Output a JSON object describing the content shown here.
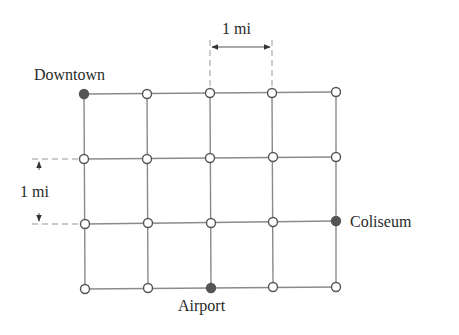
{
  "diagram": {
    "type": "street-grid",
    "columns": 5,
    "rows": 4,
    "grid_color": "#8a8a8a",
    "node_fill_open": "#ffffff",
    "node_fill_marked": "#555555",
    "labels": {
      "downtown": "Downtown",
      "coliseum": "Coliseum",
      "airport": "Airport",
      "horizontal_scale": "1 mi",
      "vertical_scale": "1 mi"
    },
    "marked_nodes": [
      {
        "name": "Downtown",
        "col": 0,
        "row": 0
      },
      {
        "name": "Coliseum",
        "col": 4,
        "row": 2
      },
      {
        "name": "Airport",
        "col": 2,
        "row": 3
      }
    ]
  }
}
